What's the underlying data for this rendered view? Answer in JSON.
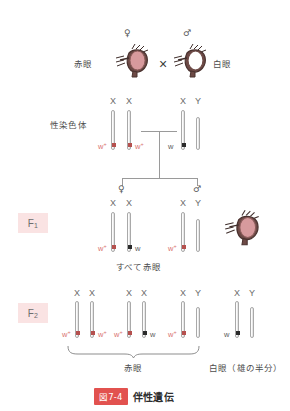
{
  "figure": {
    "tag": "図7-4",
    "title": "伴性遺伝",
    "sex_chromosome_label": "性染色体",
    "cross_symbol": "×",
    "female_symbol": "♀",
    "male_symbol": "♂"
  },
  "parents": {
    "female": {
      "phenotype_label": "赤眼",
      "sex": "♀",
      "eye_color": "#d79a9d",
      "chromosomes": [
        "X",
        "X"
      ],
      "alleles": [
        "w+",
        "w+"
      ],
      "allele_colors": [
        "#d9726f",
        "#d9726f"
      ],
      "marker_colors": [
        "red",
        "red"
      ]
    },
    "male": {
      "phenotype_label": "白眼",
      "sex": "♂",
      "eye_color": "#ffffff",
      "chromosomes": [
        "X",
        "Y"
      ],
      "alleles": [
        "w",
        ""
      ],
      "allele_colors": [
        "#5a5a5a",
        ""
      ],
      "marker_colors": [
        "black",
        "none"
      ]
    }
  },
  "f1": {
    "badge": "F1",
    "badge_sub": "1",
    "badge_main": "F",
    "result_label": "すべて赤眼",
    "female": {
      "sex": "♀",
      "chromosomes": [
        "X",
        "X"
      ],
      "alleles": [
        "w+",
        "w"
      ],
      "marker_colors": [
        "red",
        "black"
      ]
    },
    "male": {
      "sex": "♂",
      "chromosomes": [
        "X",
        "Y"
      ],
      "alleles": [
        "w+",
        ""
      ],
      "marker_colors": [
        "red",
        "none"
      ]
    },
    "fly_eye_color": "#d79a9d"
  },
  "f2": {
    "badge_main": "F",
    "badge_sub": "2",
    "genotypes": [
      {
        "chromosomes": [
          "X",
          "X"
        ],
        "left_allele": "w+",
        "right_allele": "w+",
        "marker_colors": [
          "red",
          "red"
        ],
        "allele_side_colors": [
          "#d9726f",
          "#d9726f"
        ]
      },
      {
        "chromosomes": [
          "X",
          "X"
        ],
        "left_allele": "w+",
        "right_allele": "w",
        "marker_colors": [
          "red",
          "black"
        ],
        "allele_side_colors": [
          "#d9726f",
          "#5a5a5a"
        ]
      },
      {
        "chromosomes": [
          "X",
          "Y"
        ],
        "left_allele": "w+",
        "right_allele": "",
        "marker_colors": [
          "red",
          "none"
        ],
        "allele_side_colors": [
          "#d9726f",
          ""
        ]
      },
      {
        "chromosomes": [
          "X",
          "Y"
        ],
        "left_allele": "w",
        "right_allele": "",
        "marker_colors": [
          "black",
          "none"
        ],
        "allele_side_colors": [
          "#5a5a5a",
          ""
        ]
      }
    ],
    "brace_label": "赤眼",
    "white_eye_label": "白眼（雄の半分）"
  },
  "colors": {
    "accent_red": "#e2524f",
    "allele_red": "#d9726f",
    "badge_bg": "#fae3e3",
    "line_gray": "#9a9a9a",
    "text_gray": "#4d4d4d"
  }
}
